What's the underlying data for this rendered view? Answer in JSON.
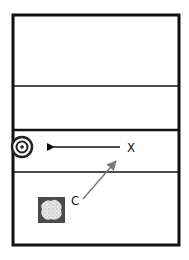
{
  "diagram": {
    "labels": {
      "x_player": "X",
      "c_player": "C"
    },
    "colors": {
      "line": "#111111",
      "arrow_gray": "#7a7a7a",
      "cone_fill": "#d6d6d6",
      "cone_border": "#4a4a4a"
    },
    "elements": {
      "target": "target-icon",
      "cone": "cone-icon",
      "pass_arrow": "arrow-left",
      "movement_arrow": "arrow-diagonal"
    }
  }
}
